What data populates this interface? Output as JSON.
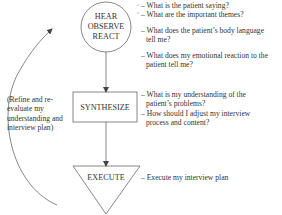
{
  "diagram": {
    "nodes": {
      "hear": {
        "lines": [
          "HEAR",
          "OBSERVE",
          "REACT"
        ],
        "shape": "circle"
      },
      "synthesize": {
        "lines": [
          "SYNTHESIZE"
        ],
        "shape": "rectangle"
      },
      "execute": {
        "lines": [
          "EXECUTE"
        ],
        "shape": "inverted-triangle"
      }
    },
    "feedback_label": [
      "(Refine and re-",
      "evaluate my",
      "understanding and",
      "interview plan)"
    ],
    "notes": {
      "hear_group1": [
        "– What is the patient saying?",
        "– What are the important themes?"
      ],
      "hear_group2": [
        "– What does the patient’s body language",
        "  tell me?"
      ],
      "hear_group3": [
        "– What does my emotional reaction to the",
        "  patient tell me?"
      ],
      "synthesize_group": [
        "– What is my understanding of the",
        "  patient’s problems?",
        "– How should I adjust my interview",
        "  process and content?"
      ],
      "execute_group": [
        "– Execute my interview plan"
      ]
    },
    "colors": {
      "stroke": "#555555",
      "text": "#333333",
      "background": "#ffffff"
    }
  }
}
